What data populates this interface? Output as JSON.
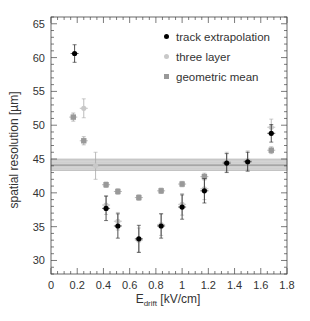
{
  "chart_data": {
    "type": "scatter",
    "title": "",
    "xlabel": "E_drift [kV/cm]",
    "xlabel_main": "E",
    "xlabel_sub": "drift",
    "xlabel_unit": " [kV/cm]",
    "ylabel": "spatial resolution [µm]",
    "xlim": [
      0,
      1.8
    ],
    "ylim": [
      28,
      66
    ],
    "xticks": [
      0,
      0.2,
      0.4,
      0.6,
      0.8,
      1,
      1.2,
      1.4,
      1.6,
      1.8
    ],
    "xtick_labels": [
      "0",
      "0.2",
      "0.4",
      "0.6",
      "0.8",
      "1",
      "1.2",
      "1.4",
      "1.6",
      "1.8"
    ],
    "yticks": [
      30,
      35,
      40,
      45,
      50,
      55,
      60,
      65
    ],
    "ytick_labels": [
      "30",
      "35",
      "40",
      "45",
      "50",
      "55",
      "60",
      "65"
    ],
    "grid": false,
    "legend_position": "upper right",
    "series": [
      {
        "name": "track extrapolation",
        "color": "#000000",
        "marker": "circle",
        "x": [
          0.18,
          0.42,
          0.51,
          0.67,
          0.84,
          1.0,
          1.17,
          1.34,
          1.5,
          1.68
        ],
        "y": [
          60.6,
          37.7,
          35.1,
          33.2,
          35.1,
          37.9,
          40.3,
          44.4,
          44.6,
          48.8
        ],
        "yerr": [
          1.3,
          1.8,
          1.8,
          2.0,
          1.8,
          1.8,
          1.8,
          1.4,
          1.4,
          1.3
        ]
      },
      {
        "name": "three layer",
        "color": "#c8c8c8",
        "marker": "circle",
        "x": [
          0.25,
          0.34,
          0.42,
          0.51,
          0.67,
          0.84,
          1.0,
          1.17,
          1.34,
          1.5,
          1.68
        ],
        "y": [
          52.5,
          44.0,
          38.2,
          35.8,
          33.0,
          35.3,
          38.3,
          40.6,
          44.6,
          44.8,
          49.7
        ],
        "yerr": [
          1.4,
          2.0,
          1.4,
          1.3,
          1.8,
          1.6,
          1.6,
          1.6,
          1.4,
          1.4,
          1.2
        ]
      },
      {
        "name": "geometric mean",
        "color": "#999999",
        "marker": "square",
        "x": [
          0.17,
          0.25,
          0.42,
          0.51,
          0.67,
          0.84,
          1.0,
          1.17,
          1.68
        ],
        "y": [
          51.2,
          47.7,
          41.2,
          40.2,
          39.3,
          40.3,
          41.3,
          42.4,
          46.3
        ],
        "yerr": [
          0.6,
          0.6,
          0.4,
          0.4,
          0.4,
          0.4,
          0.4,
          0.5,
          0.5
        ]
      }
    ],
    "band": {
      "name": "mean band",
      "y_low": 43.3,
      "y_high": 45.0,
      "y_center": 44.1,
      "color": "#bbbbbb"
    }
  },
  "legend": {
    "items": [
      {
        "label": "track extrapolation",
        "color": "#000000",
        "shape": "circle"
      },
      {
        "label": "three layer",
        "color": "#c8c8c8",
        "shape": "circle"
      },
      {
        "label": "geometric mean",
        "color": "#999999",
        "shape": "square"
      }
    ]
  }
}
